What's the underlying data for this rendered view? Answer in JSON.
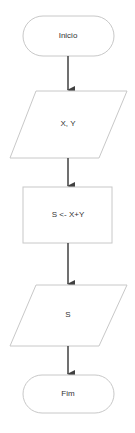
{
  "diagram": {
    "type": "flowchart",
    "colors": {
      "shape_stroke": "#c8c8c8",
      "shape_fill": "#ffffff",
      "connector": "#404040",
      "text": "#333333"
    },
    "nodes": [
      {
        "id": "start",
        "shape": "terminal",
        "label": "Inicio"
      },
      {
        "id": "input",
        "shape": "parallelogram",
        "label": "X, Y"
      },
      {
        "id": "process",
        "shape": "rectangle",
        "label": "S <- X+Y"
      },
      {
        "id": "output",
        "shape": "parallelogram",
        "label": "S"
      },
      {
        "id": "end",
        "shape": "terminal",
        "label": "Fim"
      }
    ],
    "edges": [
      {
        "from": "start",
        "to": "input"
      },
      {
        "from": "input",
        "to": "process"
      },
      {
        "from": "process",
        "to": "output"
      },
      {
        "from": "output",
        "to": "end"
      }
    ]
  }
}
